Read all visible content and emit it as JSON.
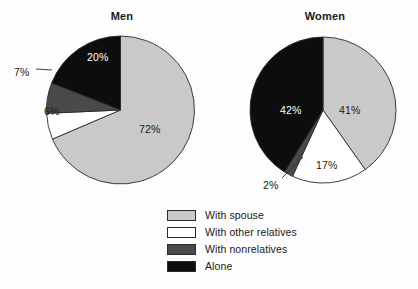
{
  "chart_data": [
    {
      "type": "pie",
      "title": "Men",
      "categories": [
        "With spouse",
        "With other relatives",
        "With nonrelatives",
        "Alone"
      ],
      "values": [
        72,
        6,
        7,
        20
      ],
      "labels": [
        "72%",
        "6%",
        "7%",
        "20%"
      ],
      "units": "percent",
      "legend_position": "bottom",
      "grid": false
    },
    {
      "type": "pie",
      "title": "Women",
      "categories": [
        "With spouse",
        "With other relatives",
        "With nonrelatives",
        "Alone"
      ],
      "values": [
        41,
        17,
        2,
        42
      ],
      "labels": [
        "41%",
        "17%",
        "2%",
        "42%"
      ],
      "units": "percent",
      "legend_position": "bottom",
      "grid": false
    }
  ],
  "titles": {
    "men": "Men",
    "women": "Women"
  },
  "legend": {
    "items": [
      {
        "label": "With spouse",
        "color": "#c9c9c9"
      },
      {
        "label": "With other relatives",
        "color": "#ffffff"
      },
      {
        "label": "With nonrelatives",
        "color": "#4a4a4a"
      },
      {
        "label": "Alone",
        "color": "#0d0d0d"
      }
    ]
  },
  "colors": {
    "with_spouse": "#c9c9c9",
    "with_other_relatives": "#ffffff",
    "with_nonrelatives": "#4a4a4a",
    "alone": "#0d0d0d",
    "outline": "#2b2b2b",
    "text": "#1a1a1a",
    "text_on_dark": "#ffffff",
    "background": "#fdfdfd"
  },
  "geometry": {
    "men": {
      "cx": 120.5,
      "cy": 110,
      "r": 74
    },
    "women": {
      "cx": 323,
      "cy": 110,
      "r": 73
    }
  },
  "men_labels": {
    "spouse": {
      "text": "72%",
      "x": 139,
      "y": 123,
      "on_dark": false
    },
    "other": {
      "text": "6%",
      "x": 44,
      "y": 105,
      "on_dark": false
    },
    "nonrelatives": {
      "text": "7%",
      "x": 14,
      "y": 66,
      "on_dark": false
    },
    "alone": {
      "text": "20%",
      "x": 87,
      "y": 51,
      "on_dark": true
    }
  },
  "women_labels": {
    "spouse": {
      "text": "41%",
      "x": 339,
      "y": 104,
      "on_dark": false
    },
    "other": {
      "text": "17%",
      "x": 316,
      "y": 159,
      "on_dark": false
    },
    "nonrelatives": {
      "text": "2%",
      "x": 263,
      "y": 179,
      "on_dark": false
    },
    "alone": {
      "text": "42%",
      "x": 280,
      "y": 104,
      "on_dark": true
    }
  },
  "leader_lines": {
    "men_nonrelatives": {
      "x1": 36,
      "y1": 69,
      "x2": 52,
      "y2": 70
    },
    "women_nonrelatives": {
      "x1": 282,
      "y1": 178,
      "x2": 303,
      "y2": 157
    }
  }
}
